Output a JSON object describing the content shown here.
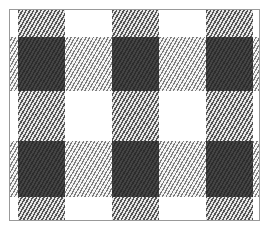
{
  "image": {
    "description": "Buffalo-check / gingham plaid fabric pattern in black, gray hatching and white",
    "caption_top": "",
    "caption_bottom": ""
  },
  "pattern": {
    "columns": [
      {
        "left": 8,
        "width": 47
      },
      {
        "left": 102,
        "width": 47
      },
      {
        "left": 196,
        "width": 47
      }
    ],
    "rows": [
      {
        "top": 27,
        "height": 54
      },
      {
        "top": 131,
        "height": 56
      }
    ],
    "colors": {
      "dark": "#333333",
      "hatch": "#555555",
      "light": "#ffffff",
      "frame": "#999999"
    }
  }
}
